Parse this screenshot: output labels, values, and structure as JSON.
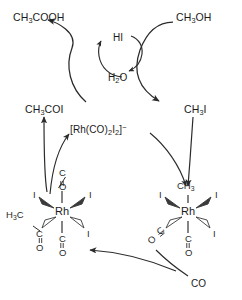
{
  "diagram": {
    "name": "Monsanto acetic acid process catalytic cycle",
    "type": "reaction-scheme",
    "stroke_color": "#2b2b2b",
    "text_color": "#1a1a1a",
    "background": "#ffffff"
  },
  "species": {
    "acetic_acid": {
      "formula_html": "CH<sub>3</sub>COOH",
      "x": 13,
      "y": 12
    },
    "methanol": {
      "formula_html": "CH<sub>3</sub>OH",
      "x": 176,
      "y": 12
    },
    "hydrogen_iodide": {
      "formula_html": "HI",
      "x": 113,
      "y": 33
    },
    "water": {
      "formula_html": "H<sub>2</sub>O",
      "x": 108,
      "y": 73
    },
    "acetyl_iodide": {
      "formula_html": "CH<sub>3</sub>COI",
      "x": 25,
      "y": 104
    },
    "methyl_iodide": {
      "formula_html": "CH<sub>3</sub>I",
      "x": 184,
      "y": 104
    },
    "catalyst": {
      "formula_html": "[Rh(CO)<sub>2</sub>I<sub>2</sub>]<sup>&#8722;</sup>",
      "x": 70,
      "y": 124
    },
    "carbon_monoxide": {
      "formula_html": "CO",
      "x": 191,
      "y": 279
    }
  },
  "complex_left": {
    "name": "acyl rhodium complex",
    "metal": "Rh",
    "metal_x": 62,
    "metal_y": 212,
    "ligands": [
      {
        "id": "co-axial-top",
        "label_c": "C",
        "label_o": "O",
        "bond": "line",
        "position": "top"
      },
      {
        "id": "iodide-upper-left",
        "label": "I",
        "bond": "wedge-solid",
        "position": "upper-left"
      },
      {
        "id": "iodide-upper-right",
        "label": "I",
        "bond": "wedge-solid",
        "position": "upper-right"
      },
      {
        "id": "acyl",
        "label": "H<sub>3</sub>C",
        "label_c": "C",
        "label_o": "O",
        "bond": "wedge-hollow",
        "position": "lower-left"
      },
      {
        "id": "iodide-lower-right",
        "label": "I",
        "bond": "wedge-hollow",
        "position": "lower-right"
      },
      {
        "id": "co-axial-bottom",
        "label_c": "C",
        "label_o": "O",
        "bond": "line",
        "position": "bottom"
      }
    ]
  },
  "complex_right": {
    "name": "methyl rhodium complex",
    "metal": "Rh",
    "metal_x": 188,
    "metal_y": 212,
    "ligands": [
      {
        "id": "methyl-top",
        "label": "CH<sub>3</sub>",
        "bond": "line",
        "position": "top"
      },
      {
        "id": "iodide-upper-left",
        "label": "I",
        "bond": "wedge-solid",
        "position": "upper-left"
      },
      {
        "id": "iodide-upper-right",
        "label": "I",
        "bond": "wedge-solid",
        "position": "upper-right"
      },
      {
        "id": "co-lower-left",
        "label_c": "C",
        "label_o": "O",
        "bond": "wedge-hollow",
        "position": "lower-left"
      },
      {
        "id": "iodide-lower-right",
        "label": "I",
        "bond": "wedge-hollow",
        "position": "lower-right"
      },
      {
        "id": "co-axial-bottom",
        "label_c": "C",
        "label_o": "O",
        "bond": "line",
        "position": "bottom"
      }
    ]
  },
  "chart_data": {
    "type": "diagram",
    "nodes": [
      "CH3COOH",
      "CH3OH",
      "HI",
      "H2O",
      "CH3COI",
      "CH3I",
      "[Rh(CO)2I2]-",
      "CO",
      "acyl-Rh-complex",
      "methyl-Rh-complex"
    ],
    "edges": [
      {
        "from": "CH3OH",
        "to": "CH3I",
        "via": "HI / -H2O"
      },
      {
        "from": "CH3COI",
        "to": "CH3COOH",
        "via": "H2O / -HI"
      },
      {
        "from": "CH3I",
        "to": "methyl-Rh-complex",
        "via": "oxidative addition"
      },
      {
        "from": "[Rh(CO)2I2]-",
        "to": "methyl-Rh-complex",
        "via": "oxidative addition"
      },
      {
        "from": "methyl-Rh-complex",
        "to": "acyl-Rh-complex",
        "via": "CO migratory insertion"
      },
      {
        "from": "CO",
        "to": "methyl-Rh-complex",
        "via": "CO coordination"
      },
      {
        "from": "acyl-Rh-complex",
        "to": "CH3COI",
        "via": "reductive elimination"
      },
      {
        "from": "acyl-Rh-complex",
        "to": "[Rh(CO)2I2]-",
        "via": "reductive elimination"
      }
    ]
  }
}
